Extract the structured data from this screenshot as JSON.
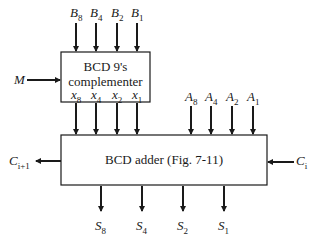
{
  "diagram": {
    "complementer": {
      "title_line1": "BCD 9's",
      "title_line2": "complementer",
      "inputs": [
        {
          "name": "B",
          "sub": "8"
        },
        {
          "name": "B",
          "sub": "4"
        },
        {
          "name": "B",
          "sub": "2"
        },
        {
          "name": "B",
          "sub": "1"
        }
      ],
      "outputs": [
        {
          "name": "x",
          "sub": "8"
        },
        {
          "name": "x",
          "sub": "4"
        },
        {
          "name": "x",
          "sub": "2"
        },
        {
          "name": "x",
          "sub": "1"
        }
      ],
      "control": {
        "name": "M"
      }
    },
    "adder": {
      "title": "BCD adder (Fig. 7-11)",
      "a_inputs": [
        {
          "name": "A",
          "sub": "8"
        },
        {
          "name": "A",
          "sub": "4"
        },
        {
          "name": "A",
          "sub": "2"
        },
        {
          "name": "A",
          "sub": "1"
        }
      ],
      "carry_in": {
        "name": "C",
        "sub": "i"
      },
      "carry_out": {
        "name": "C",
        "sub": "i+1"
      },
      "outputs": [
        {
          "name": "S",
          "sub": "8"
        },
        {
          "name": "S",
          "sub": "4"
        },
        {
          "name": "S",
          "sub": "2"
        },
        {
          "name": "S",
          "sub": "1"
        }
      ]
    }
  }
}
